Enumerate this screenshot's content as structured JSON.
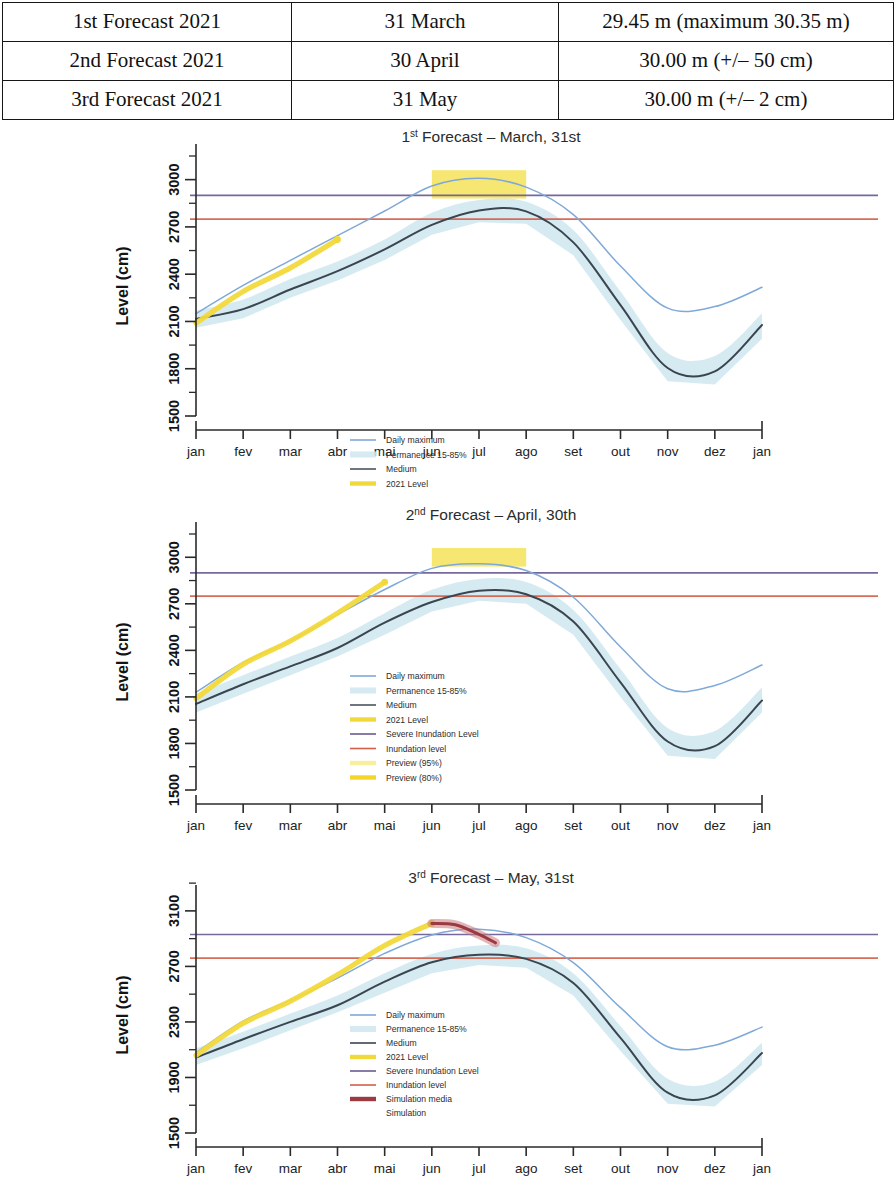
{
  "table": {
    "rows": [
      {
        "label": "1st Forecast 2021",
        "date": "31 March",
        "value": "29.45 m (maximum 30.35 m)"
      },
      {
        "label": "2nd Forecast 2021",
        "date": "30 April",
        "value": "30.00 m (+/– 50 cm)"
      },
      {
        "label": "3rd Forecast 2021",
        "date": "31 May",
        "value": "30.00 m (+/– 2 cm)"
      }
    ]
  },
  "colors": {
    "daily_maximum": "#7fa9d8",
    "permanence_band": "#cfe6ee",
    "medium": "#3a4550",
    "level_2021": "#f2d93b",
    "severe_inundation": "#6b5b93",
    "inundation": "#d4604a",
    "preview_band": "#f4e04a",
    "simulation_media": "#9c3a42",
    "simulation_band": "#c97a80",
    "axis": "#2a2a2a"
  },
  "charts": [
    {
      "id": "forecast-1",
      "title_ordinal": "1",
      "title_sup": "st",
      "title_rest": " Forecast – March, 31st",
      "ylabel": "Level (cm)",
      "yticks": [
        "1500",
        "1800",
        "2100",
        "2400",
        "2700",
        "3000"
      ],
      "xticks": [
        "jan",
        "fev",
        "mar",
        "abr",
        "mai",
        "jun",
        "jul",
        "ago",
        "set",
        "out",
        "nov",
        "dez",
        "jan"
      ],
      "legend": [
        {
          "label": "Daily maximum",
          "style": "line",
          "color": "#7fa9d8"
        },
        {
          "label": "Permanence 15-85%",
          "style": "band",
          "color": "#cfe6ee"
        },
        {
          "label": "Medium",
          "style": "line",
          "color": "#4a545f"
        },
        {
          "label": "2021 Level",
          "style": "thick",
          "color": "#f2d93b"
        },
        {
          "label": "Severe  Inundation Level",
          "style": "line",
          "color": "#6b5b93"
        },
        {
          "label": "Inundation level",
          "style": "line",
          "color": "#d4604a"
        },
        {
          "label": "Preview (90%)",
          "style": "thick",
          "color": "#f4e04a"
        }
      ]
    },
    {
      "id": "forecast-2",
      "title_ordinal": "2",
      "title_sup": "nd",
      "title_rest": " Forecast – April, 30th",
      "ylabel": "Level (cm)",
      "yticks": [
        "1500",
        "1800",
        "2100",
        "2400",
        "2700",
        "3000"
      ],
      "xticks": [
        "jan",
        "fev",
        "mar",
        "abr",
        "mai",
        "jun",
        "jul",
        "ago",
        "set",
        "out",
        "nov",
        "dez",
        "jan"
      ],
      "legend": [
        {
          "label": "Daily maximum",
          "style": "line",
          "color": "#7fa9d8"
        },
        {
          "label": "Permanence 15-85%",
          "style": "band",
          "color": "#cfe6ee"
        },
        {
          "label": "Medium",
          "style": "line",
          "color": "#4a545f"
        },
        {
          "label": "2021 Level",
          "style": "thick",
          "color": "#f2d93b"
        },
        {
          "label": "Severe  Inundation Level",
          "style": "line",
          "color": "#6b5b93"
        },
        {
          "label": "Inundation level",
          "style": "line",
          "color": "#d4604a"
        },
        {
          "label": "Preview (95%)",
          "style": "thick",
          "color": "#f8ef9a"
        },
        {
          "label": "Preview (80%)",
          "style": "thick",
          "color": "#f4d62a"
        }
      ]
    },
    {
      "id": "forecast-3",
      "title_ordinal": "3",
      "title_sup": "rd",
      "title_rest": " Forecast – May, 31st",
      "ylabel": "Level (cm)",
      "yticks": [
        "1500",
        "1900",
        "2300",
        "2700",
        "3100"
      ],
      "xticks": [
        "jan",
        "fev",
        "mar",
        "abr",
        "mai",
        "jun",
        "jul",
        "ago",
        "set",
        "out",
        "nov",
        "dez",
        "jan"
      ],
      "legend": [
        {
          "label": "Daily maximum",
          "style": "line",
          "color": "#7fa9d8"
        },
        {
          "label": "Permanence 15-85%",
          "style": "band",
          "color": "#cfe6ee"
        },
        {
          "label": "Medium",
          "style": "line",
          "color": "#3a4550"
        },
        {
          "label": "2021 Level",
          "style": "thick",
          "color": "#f2d93b"
        },
        {
          "label": "Severe  Inundation Level",
          "style": "line",
          "color": "#6b5b93"
        },
        {
          "label": "Inundation level",
          "style": "line",
          "color": "#d4604a"
        },
        {
          "label": "Simulation media",
          "style": "thick",
          "color": "#9c3a42"
        },
        {
          "label": "Simulation",
          "style": "none",
          "color": "#c97a80"
        }
      ]
    }
  ],
  "chart_data": [
    {
      "type": "line",
      "title": "1st Forecast – March, 31st",
      "xlabel": "",
      "ylabel": "Level (cm)",
      "ylim": [
        1500,
        3150
      ],
      "yticks": [
        1500,
        1800,
        2100,
        2400,
        2700,
        3000
      ],
      "x": [
        "jan",
        "fev",
        "mar",
        "abr",
        "mai",
        "jun",
        "jul",
        "ago",
        "set",
        "out",
        "nov",
        "dez",
        "jan"
      ],
      "grid": false,
      "legend_position": "center",
      "series": [
        {
          "name": "Daily maximum",
          "color": "#7fa9d8",
          "values": [
            2150,
            2330,
            2480,
            2640,
            2800,
            2960,
            3000,
            2960,
            2780,
            2450,
            2180,
            2200,
            2320
          ]
        },
        {
          "name": "Medium",
          "color": "#3a4550",
          "values": [
            2120,
            2180,
            2310,
            2420,
            2550,
            2720,
            2800,
            2790,
            2600,
            2200,
            1810,
            1790,
            2070
          ]
        },
        {
          "name": "Permanence 15-85% upper",
          "color": "#cfe6ee",
          "values": [
            2170,
            2240,
            2370,
            2480,
            2620,
            2790,
            2870,
            2860,
            2680,
            2290,
            1900,
            1880,
            2150
          ]
        },
        {
          "name": "Permanence 15-85% lower",
          "color": "#cfe6ee",
          "values": [
            2060,
            2120,
            2250,
            2360,
            2490,
            2650,
            2730,
            2720,
            2520,
            2110,
            1720,
            1700,
            1990
          ]
        },
        {
          "name": "2021 Level",
          "color": "#f2d93b",
          "values": [
            2090,
            2290,
            2440,
            2620,
            null,
            null,
            null,
            null,
            null,
            null,
            null,
            null,
            null
          ]
        }
      ],
      "reference_lines": [
        {
          "name": "Severe Inundation Level",
          "value": 2900,
          "color": "#6b5b93"
        },
        {
          "name": "Inundation level",
          "value": 2750,
          "color": "#d4604a"
        }
      ],
      "annotations": [
        {
          "name": "Preview (90%)",
          "type": "band",
          "x_from": "jun",
          "x_to": "ago",
          "y_from": 2880,
          "y_to": 3060,
          "color": "#f4e04a"
        }
      ]
    },
    {
      "type": "line",
      "title": "2nd Forecast – April, 30th",
      "xlabel": "",
      "ylabel": "Level (cm)",
      "ylim": [
        1500,
        3150
      ],
      "yticks": [
        1500,
        1800,
        2100,
        2400,
        2700,
        3000
      ],
      "x": [
        "jan",
        "fev",
        "mar",
        "abr",
        "mai",
        "jun",
        "jul",
        "ago",
        "set",
        "out",
        "nov",
        "dez",
        "jan"
      ],
      "grid": false,
      "legend_position": "center",
      "series": [
        {
          "name": "Daily maximum",
          "color": "#7fa9d8",
          "values": [
            2130,
            2320,
            2470,
            2630,
            2790,
            2930,
            2960,
            2920,
            2740,
            2420,
            2160,
            2180,
            2300
          ]
        },
        {
          "name": "Medium",
          "color": "#3a4550",
          "values": [
            2060,
            2180,
            2300,
            2420,
            2570,
            2720,
            2790,
            2770,
            2580,
            2190,
            1810,
            1790,
            2080
          ]
        },
        {
          "name": "Permanence 15-85% upper",
          "color": "#cfe6ee",
          "values": [
            2120,
            2240,
            2360,
            2480,
            2640,
            2790,
            2860,
            2840,
            2660,
            2280,
            1900,
            1880,
            2160
          ]
        },
        {
          "name": "Permanence 15-85% lower",
          "color": "#cfe6ee",
          "values": [
            2000,
            2120,
            2240,
            2360,
            2500,
            2650,
            2720,
            2700,
            2500,
            2100,
            1720,
            1700,
            2000
          ]
        },
        {
          "name": "2021 Level",
          "color": "#f2d93b",
          "values": [
            2090,
            2310,
            2460,
            2640,
            2840,
            null,
            null,
            null,
            null,
            null,
            null,
            null,
            null
          ]
        }
      ],
      "reference_lines": [
        {
          "name": "Severe Inundation Level",
          "value": 2900,
          "color": "#6b5b93"
        },
        {
          "name": "Inundation level",
          "value": 2750,
          "color": "#d4604a"
        }
      ],
      "annotations": [
        {
          "name": "Preview (95%)",
          "type": "band",
          "x_from": "jun",
          "x_to": "ago",
          "y_from": 2940,
          "y_to": 3060,
          "color": "#f4e04a"
        }
      ]
    },
    {
      "type": "line",
      "title": "3rd Forecast – May, 31st",
      "xlabel": "",
      "ylabel": "Level (cm)",
      "ylim": [
        1500,
        3200
      ],
      "yticks": [
        1500,
        1900,
        2300,
        2700,
        3100
      ],
      "x": [
        "jan",
        "fev",
        "mar",
        "abr",
        "mai",
        "jun",
        "jul",
        "ago",
        "set",
        "out",
        "nov",
        "dez",
        "jan"
      ],
      "grid": false,
      "legend_position": "center",
      "series": [
        {
          "name": "Daily maximum",
          "color": "#7fa9d8",
          "values": [
            2080,
            2300,
            2460,
            2620,
            2790,
            2930,
            2960,
            2910,
            2720,
            2400,
            2120,
            2140,
            2270
          ]
        },
        {
          "name": "Medium",
          "color": "#3a4550",
          "values": [
            2050,
            2170,
            2300,
            2430,
            2580,
            2720,
            2780,
            2760,
            2570,
            2180,
            1800,
            1780,
            2070
          ]
        },
        {
          "name": "Permanence 15-85% upper",
          "color": "#cfe6ee",
          "values": [
            2110,
            2230,
            2360,
            2490,
            2650,
            2790,
            2850,
            2830,
            2650,
            2270,
            1890,
            1870,
            2150
          ]
        },
        {
          "name": "Permanence 15-85% lower",
          "color": "#cfe6ee",
          "values": [
            1990,
            2110,
            2240,
            2370,
            2510,
            2650,
            2710,
            2690,
            2490,
            2090,
            1710,
            1690,
            1990
          ]
        },
        {
          "name": "2021 Level",
          "color": "#f2d93b",
          "values": [
            2060,
            2290,
            2450,
            2640,
            2850,
            3010,
            null,
            null,
            null,
            null,
            null,
            null,
            null
          ]
        },
        {
          "name": "Simulation media",
          "color": "#9c3a42",
          "values": [
            null,
            null,
            null,
            null,
            null,
            3010,
            2930,
            null,
            null,
            null,
            null,
            null,
            null
          ]
        }
      ],
      "reference_lines": [
        {
          "name": "Severe Inundation Level",
          "value": 2930,
          "color": "#6b5b93"
        },
        {
          "name": "Inundation level",
          "value": 2760,
          "color": "#d4604a"
        }
      ],
      "annotations": []
    }
  ]
}
